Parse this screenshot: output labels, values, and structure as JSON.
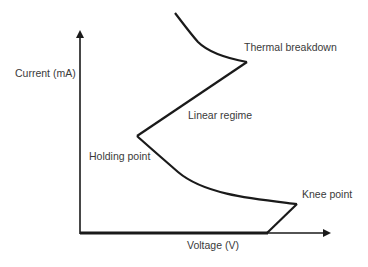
{
  "diagram": {
    "type": "snapback I-V characteristic",
    "axes": {
      "y_label": "Current (mA)",
      "x_label": "Voltage (V)"
    },
    "annotations": {
      "thermal_breakdown": "Thermal breakdown",
      "linear_regime": "Linear regime",
      "holding_point": "Holding point",
      "knee_point": "Knee point"
    },
    "colors": {
      "curve": "#1a1a1a",
      "axis": "#1a1a1a",
      "text": "#3a3a3a",
      "background": "#ffffff"
    }
  }
}
